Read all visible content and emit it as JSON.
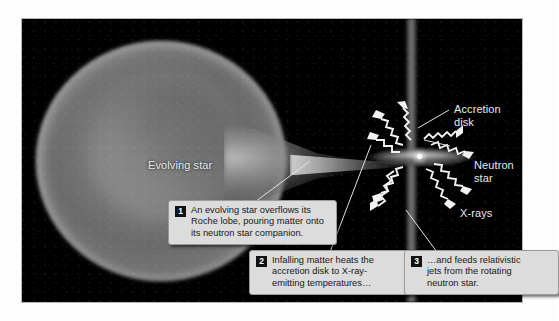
{
  "figure": {
    "background_color": "#ffffff",
    "scene_color": "#000000"
  },
  "labels": {
    "evolving_star": "Evolving star",
    "accretion_disk": "Accretion\ndisk",
    "neutron_star": "Neutron star",
    "xrays": "X-rays"
  },
  "callouts": [
    {
      "number": "1",
      "text": "An evolving star overflows its\nRoche lobe, pouring matter onto\nits neutron star companion."
    },
    {
      "number": "2",
      "text": "Infalling matter heats the\naccretion disk to X-ray-\nemitting temperatures…"
    },
    {
      "number": "3",
      "text": "…and feeds relativistic\njets from the rotating\nneutron star."
    }
  ],
  "colors": {
    "callout_background": "#dcdcdc",
    "callout_border": "#9a9a9a",
    "callout_text": "#16181a",
    "badge_background": "#111111",
    "badge_text": "#ffffff",
    "label_text": "#e9e9e9",
    "jet_gray": "#969696",
    "star_gray": "#8a8a8a",
    "rim_white": "#e8e8e8"
  }
}
